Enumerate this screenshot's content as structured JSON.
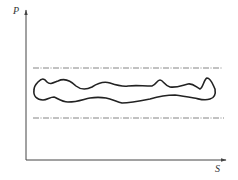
{
  "diagram": {
    "y_axis_label": "P",
    "x_axis_label": "S",
    "elements": [
      {
        "type": "axis",
        "orientation": "vertical",
        "label": "P"
      },
      {
        "type": "axis",
        "orientation": "horizontal",
        "label": "S"
      },
      {
        "type": "dash-dot-line",
        "role": "upper-limit"
      },
      {
        "type": "dash-dot-line",
        "role": "lower-limit"
      },
      {
        "type": "closed-wavy-curve",
        "role": "bounded-region"
      }
    ],
    "colors": {
      "axis": "#444444",
      "curve": "#222222",
      "dashed": "#666666"
    }
  }
}
